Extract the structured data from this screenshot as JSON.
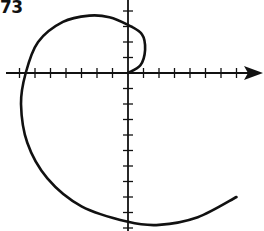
{
  "problem_label": "73",
  "colors": {
    "ink": "#111111",
    "background": "#ffffff"
  },
  "chart_data": {
    "type": "line",
    "title": "",
    "xlabel": "",
    "ylabel": "",
    "axes": {
      "origin_px": [
        128,
        73
      ],
      "tick_spacing_px": 15.5,
      "x_ticks_left": 7,
      "x_ticks_right": 7,
      "y_ticks_above": 4,
      "y_ticks_below": 10,
      "x_arrow": true,
      "grid": false
    },
    "x_range_units": [
      -7,
      8.5
    ],
    "y_range_units": [
      -10,
      4.7
    ],
    "series": [
      {
        "name": "spiral",
        "points_units": [
          [
            0,
            0
          ],
          [
            0.8,
            0.5
          ],
          [
            1.1,
            1.5
          ],
          [
            0.9,
            2.5
          ],
          [
            0,
            3.1
          ],
          [
            -1.2,
            3.6
          ],
          [
            -2.5,
            3.7
          ],
          [
            -4.2,
            3.3
          ],
          [
            -5.8,
            2.0
          ],
          [
            -6.6,
            0
          ],
          [
            -6.9,
            -2.0
          ],
          [
            -6.5,
            -4.5
          ],
          [
            -5.2,
            -6.8
          ],
          [
            -3.0,
            -8.6
          ],
          [
            0,
            -9.6
          ],
          [
            2.0,
            -9.8
          ],
          [
            4.5,
            -9.3
          ],
          [
            7.0,
            -8.0
          ]
        ]
      }
    ]
  }
}
